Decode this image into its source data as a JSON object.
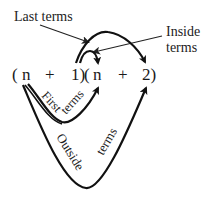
{
  "labels": {
    "last_terms": "Last terms",
    "inside_line1": "Inside",
    "inside_line2": "terms",
    "first_word1": "First",
    "first_word2": "terms",
    "outside_word1": "Outside",
    "outside_word2": "terms"
  },
  "expression": {
    "open1": "(",
    "a": "n",
    "plus1": "+",
    "b": "1)",
    "open2": "(",
    "c": "n",
    "plus2": "+",
    "d": "2)"
  },
  "colors": {
    "ink": "#111111",
    "background": "#ffffff"
  }
}
